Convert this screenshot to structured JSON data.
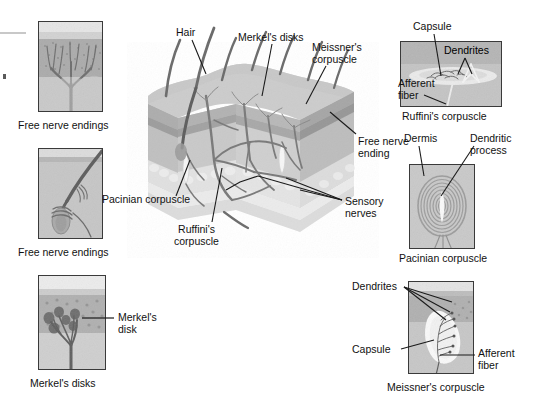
{
  "figure": {
    "background": "#ffffff",
    "width": 540,
    "height": 412,
    "palette": {
      "ink": "#111111",
      "leader_line": "#1a1a1a",
      "panel_border": "#3a3a3a",
      "epidermis": "#b9b9b9",
      "dermis": "#cdcdcd",
      "hypodermis": "#e2e2e2",
      "nerve": "#6f6f6f",
      "hair": "#6a6a6a",
      "stratum": "#d8d8d8"
    }
  },
  "left_panels": [
    {
      "id": "free-nerve-endings-1",
      "caption": "Free nerve endings",
      "x": 38,
      "y": 21,
      "w": 65,
      "h": 91,
      "caption_x": 18,
      "caption_y": 120
    },
    {
      "id": "free-nerve-endings-2",
      "caption": "Free nerve endings",
      "x": 38,
      "y": 148,
      "w": 65,
      "h": 91,
      "caption_x": 18,
      "caption_y": 247
    },
    {
      "id": "merkels-disks",
      "caption": "Merkel's disks",
      "x": 38,
      "y": 275,
      "w": 68,
      "h": 95,
      "caption_x": 30,
      "caption_y": 378,
      "inner_label": "Merkel's\ndisk",
      "inner_label_x": 118,
      "inner_label_y": 312
    }
  ],
  "right_panels": [
    {
      "id": "ruffinis-corpuscle",
      "caption": "Ruffini's corpuscle",
      "x": 400,
      "y": 41,
      "w": 102,
      "h": 66,
      "caption_x": 402,
      "caption_y": 111,
      "labels": [
        {
          "text": "Capsule",
          "x": 413,
          "y": 21
        },
        {
          "text": "Dendrites",
          "x": 444,
          "y": 45
        },
        {
          "text": "Afferent\nfiber",
          "x": 398,
          "y": 82
        }
      ]
    },
    {
      "id": "pacinian-corpuscle",
      "caption": "Pacinian corpuscle",
      "x": 409,
      "y": 164,
      "w": 66,
      "h": 85,
      "caption_x": 406,
      "caption_y": 253,
      "labels": [
        {
          "text": "Dermis",
          "x": 404,
          "y": 133
        },
        {
          "text": "Dendritic\nprocess",
          "x": 470,
          "y": 133
        }
      ]
    },
    {
      "id": "meissners-corpuscle",
      "caption": "Meissner's corpuscle",
      "x": 408,
      "y": 281,
      "w": 66,
      "h": 93,
      "caption_x": 392,
      "caption_y": 382,
      "labels": [
        {
          "text": "Dendrites",
          "x": 352,
          "y": 281
        },
        {
          "text": "Capsule",
          "x": 352,
          "y": 344
        },
        {
          "text": "Afferent\nfiber",
          "x": 478,
          "y": 348
        }
      ]
    }
  ],
  "center_labels": [
    {
      "id": "hair",
      "text": "Hair",
      "x": 176,
      "y": 27
    },
    {
      "id": "merkels-disks",
      "text": "Merkel's disks",
      "x": 238,
      "y": 32
    },
    {
      "id": "meissners-corpuscle",
      "text": "Meissner's\ncorpuscle",
      "x": 312,
      "y": 42
    },
    {
      "id": "free-nerve-ending",
      "text": "Free nerve\nending",
      "x": 358,
      "y": 136
    },
    {
      "id": "sensory-nerves",
      "text": "Sensory\nnerves",
      "x": 345,
      "y": 196
    },
    {
      "id": "pacinian-corpuscle",
      "text": "Pacinian corpuscle",
      "x": 102,
      "y": 194
    },
    {
      "id": "ruffinis-corpuscle",
      "text": "Ruffini's\ncorpuscle",
      "x": 174,
      "y": 224
    }
  ],
  "edge_artifacts": [
    {
      "id": "crop-rule",
      "x": 0,
      "y": 32,
      "w": 26,
      "h": 2
    },
    {
      "id": "crop-mark",
      "x": 3,
      "y": 74,
      "w": 3,
      "h": 5
    }
  ]
}
